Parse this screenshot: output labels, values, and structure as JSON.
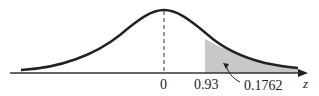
{
  "diagram": {
    "type": "standard-normal-curve",
    "axis_label": "z",
    "ticks": [
      {
        "label": "0",
        "value": 0
      },
      {
        "label": "0.93",
        "value": 0.93
      }
    ],
    "shaded_region": {
      "from": 0.93,
      "to": "infinity",
      "area_label": "0.1762"
    },
    "colors": {
      "curve": "#222222",
      "shade": "#c8c8c8",
      "axis": "#333333"
    }
  }
}
